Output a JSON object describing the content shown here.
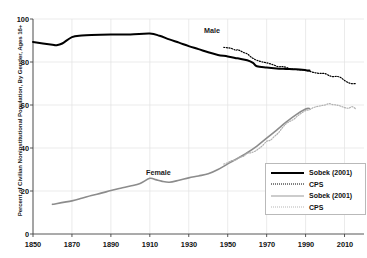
{
  "chart_data": {
    "type": "line",
    "title": "",
    "xlabel": "",
    "ylabel": "Percent of Civilian Noninstitutional Population, By Gender, Ages 16+",
    "xlim": [
      1850,
      2020
    ],
    "ylim": [
      0,
      100
    ],
    "grid": true,
    "xticks": [
      1850,
      1870,
      1890,
      1910,
      1930,
      1950,
      1970,
      1990,
      2010
    ],
    "yticks": [
      0,
      20,
      40,
      60,
      80,
      100
    ],
    "annotations": [
      {
        "text": "Male",
        "x": 1952,
        "y": 89
      },
      {
        "text": "Female",
        "x": 1913,
        "y": 31
      }
    ],
    "legend_position": "lower-right",
    "series": [
      {
        "name": "Sobek (2001)",
        "gender": "Male",
        "style": "solid",
        "color": "#000000",
        "width": 2.0,
        "points": [
          [
            1850,
            89.3
          ],
          [
            1860,
            88.0
          ],
          [
            1862,
            87.8
          ],
          [
            1865,
            88.6
          ],
          [
            1870,
            91.6
          ],
          [
            1875,
            92.3
          ],
          [
            1880,
            92.6
          ],
          [
            1890,
            92.8
          ],
          [
            1900,
            92.8
          ],
          [
            1910,
            93.2
          ],
          [
            1915,
            92.2
          ],
          [
            1920,
            90.5
          ],
          [
            1925,
            89.0
          ],
          [
            1930,
            87.4
          ],
          [
            1935,
            86.0
          ],
          [
            1940,
            84.5
          ],
          [
            1945,
            83.3
          ],
          [
            1950,
            82.6
          ],
          [
            1955,
            81.7
          ],
          [
            1960,
            80.8
          ],
          [
            1963,
            79.6
          ],
          [
            1965,
            78.0
          ],
          [
            1970,
            77.4
          ],
          [
            1975,
            77.0
          ],
          [
            1980,
            76.8
          ],
          [
            1985,
            76.6
          ],
          [
            1990,
            76.2
          ],
          [
            1992,
            76.0
          ]
        ]
      },
      {
        "name": "CPS",
        "gender": "Male",
        "style": "dotted",
        "color": "#000000",
        "width": 1.2,
        "points": [
          [
            1948,
            86.8
          ],
          [
            1950,
            86.6
          ],
          [
            1952,
            86.3
          ],
          [
            1954,
            85.5
          ],
          [
            1955,
            85.7
          ],
          [
            1956,
            85.4
          ],
          [
            1958,
            84.5
          ],
          [
            1960,
            83.8
          ],
          [
            1962,
            82.3
          ],
          [
            1964,
            81.2
          ],
          [
            1966,
            80.5
          ],
          [
            1968,
            80.0
          ],
          [
            1970,
            79.6
          ],
          [
            1972,
            79.1
          ],
          [
            1974,
            78.5
          ],
          [
            1976,
            77.8
          ],
          [
            1978,
            77.9
          ],
          [
            1980,
            77.5
          ],
          [
            1982,
            76.8
          ],
          [
            1984,
            76.6
          ],
          [
            1986,
            76.4
          ],
          [
            1988,
            76.3
          ],
          [
            1990,
            76.2
          ],
          [
            1992,
            75.7
          ],
          [
            1994,
            75.2
          ],
          [
            1996,
            74.8
          ],
          [
            1998,
            74.7
          ],
          [
            2000,
            74.6
          ],
          [
            2002,
            73.7
          ],
          [
            2004,
            73.2
          ],
          [
            2006,
            73.3
          ],
          [
            2008,
            72.8
          ],
          [
            2010,
            71.4
          ],
          [
            2012,
            70.4
          ],
          [
            2014,
            69.9
          ],
          [
            2016,
            70.0
          ]
        ]
      },
      {
        "name": "Sobek (2001)",
        "gender": "Female",
        "style": "solid",
        "color": "#8c8c8c",
        "width": 1.6,
        "points": [
          [
            1860,
            13.8
          ],
          [
            1870,
            15.4
          ],
          [
            1875,
            16.6
          ],
          [
            1880,
            17.9
          ],
          [
            1885,
            19.0
          ],
          [
            1890,
            20.2
          ],
          [
            1895,
            21.3
          ],
          [
            1900,
            22.3
          ],
          [
            1905,
            23.5
          ],
          [
            1910,
            25.9
          ],
          [
            1913,
            25.3
          ],
          [
            1916,
            24.6
          ],
          [
            1920,
            24.1
          ],
          [
            1925,
            25.0
          ],
          [
            1930,
            26.1
          ],
          [
            1935,
            27.0
          ],
          [
            1940,
            28.0
          ],
          [
            1945,
            30.0
          ],
          [
            1950,
            32.6
          ],
          [
            1955,
            35.1
          ],
          [
            1960,
            37.8
          ],
          [
            1965,
            40.9
          ],
          [
            1970,
            44.6
          ],
          [
            1975,
            48.2
          ],
          [
            1980,
            52.0
          ],
          [
            1985,
            55.4
          ],
          [
            1990,
            58.1
          ],
          [
            1992,
            58.4
          ]
        ]
      },
      {
        "name": "CPS",
        "gender": "Female",
        "style": "dotted",
        "color": "#b0b0b0",
        "width": 1.2,
        "points": [
          [
            1948,
            32.5
          ],
          [
            1950,
            33.2
          ],
          [
            1952,
            34.1
          ],
          [
            1954,
            34.4
          ],
          [
            1956,
            35.6
          ],
          [
            1958,
            36.1
          ],
          [
            1960,
            37.5
          ],
          [
            1962,
            37.8
          ],
          [
            1964,
            38.5
          ],
          [
            1966,
            39.7
          ],
          [
            1968,
            41.2
          ],
          [
            1970,
            43.1
          ],
          [
            1972,
            43.7
          ],
          [
            1974,
            45.4
          ],
          [
            1976,
            47.0
          ],
          [
            1978,
            49.3
          ],
          [
            1980,
            51.3
          ],
          [
            1982,
            52.4
          ],
          [
            1984,
            53.4
          ],
          [
            1986,
            55.0
          ],
          [
            1988,
            56.3
          ],
          [
            1990,
            57.4
          ],
          [
            1992,
            57.8
          ],
          [
            1994,
            58.8
          ],
          [
            1996,
            59.3
          ],
          [
            1998,
            59.7
          ],
          [
            2000,
            60.0
          ],
          [
            2002,
            60.6
          ],
          [
            2004,
            60.2
          ],
          [
            2006,
            60.0
          ],
          [
            2008,
            59.5
          ],
          [
            2010,
            58.8
          ],
          [
            2012,
            58.5
          ],
          [
            2014,
            59.2
          ],
          [
            2016,
            58.0
          ]
        ]
      }
    ]
  },
  "axes": {
    "y_label": "Percent of Civilian Noninstitutional Population, By Gender, Ages 16+",
    "y_ticks": [
      "0",
      "20",
      "40",
      "60",
      "80",
      "100"
    ],
    "x_ticks": [
      "1850",
      "1870",
      "1890",
      "1910",
      "1930",
      "1950",
      "1970",
      "1990",
      "2010"
    ]
  },
  "series_labels": {
    "male": "Male",
    "female": "Female"
  },
  "legend": {
    "entries": [
      {
        "label": "Sobek (2001)",
        "style": "solid",
        "color": "#000000"
      },
      {
        "label": "CPS",
        "style": "dotted",
        "color": "#000000"
      },
      {
        "label": "Sobek (2001)",
        "style": "solid",
        "color": "#8c8c8c"
      },
      {
        "label": "CPS",
        "style": "dotted",
        "color": "#b0b0b0"
      }
    ]
  },
  "colors": {
    "male": "#000000",
    "female": "#8c8c8c",
    "grid": "#e2e2e2",
    "axis": "#444444",
    "background": "#ffffff"
  }
}
